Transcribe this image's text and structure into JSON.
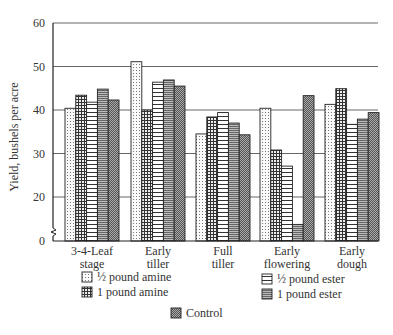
{
  "chart_data": {
    "type": "bar",
    "title": "",
    "xlabel": "",
    "ylabel": "Yield, bushels per acre",
    "ylim": [
      0,
      60
    ],
    "yticks": [
      0,
      20,
      30,
      40,
      50,
      60
    ],
    "axis_break": true,
    "grid": true,
    "legend_position": "bottom",
    "categories": [
      [
        "3-4-Leaf",
        "stage"
      ],
      [
        "Early",
        "tiller"
      ],
      [
        "Full",
        "tiller"
      ],
      [
        "Early",
        "flowering"
      ],
      [
        "Early",
        "dough"
      ]
    ],
    "series": [
      {
        "name": "½ pound amine",
        "pattern": "dots",
        "values": [
          40.4,
          51.1,
          34.5,
          40.4,
          41.3
        ]
      },
      {
        "name": "1 pound amine",
        "pattern": "grid",
        "values": [
          43.4,
          40.0,
          38.4,
          30.8,
          44.9
        ]
      },
      {
        "name": "½ pound ester",
        "pattern": "hlines",
        "values": [
          41.8,
          46.4,
          39.4,
          27.1,
          36.7
        ]
      },
      {
        "name": "1 pound ester",
        "pattern": "densehlines",
        "values": [
          44.8,
          46.9,
          37.0,
          13.7,
          37.9
        ]
      },
      {
        "name": "Control",
        "pattern": "checker",
        "values": [
          42.3,
          45.5,
          34.3,
          43.3,
          39.4
        ]
      }
    ]
  },
  "legend": {
    "items": [
      {
        "label": "½ pound amine"
      },
      {
        "label": "1 pound amine"
      },
      {
        "label": "½ pound ester"
      },
      {
        "label": "1 pound ester"
      },
      {
        "label": "Control"
      }
    ]
  }
}
